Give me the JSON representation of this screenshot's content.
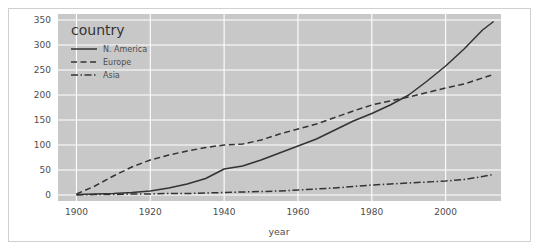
{
  "chart_data": {
    "type": "line",
    "title": "",
    "xlabel": "year",
    "ylabel": "",
    "xlim": [
      1895,
      2015
    ],
    "ylim": [
      -12,
      362
    ],
    "xticks": [
      1900,
      1920,
      1940,
      1960,
      1980,
      2000
    ],
    "yticks": [
      0,
      50,
      100,
      150,
      200,
      250,
      300,
      350
    ],
    "grid": true,
    "legend_title": "country",
    "legend_position": "inside top-left",
    "plot_background": "#c8c8c8",
    "figure_background": "#ffffff",
    "grid_color": "#ffffff",
    "line_color": "#333333",
    "border_color": "#d0d0d0",
    "x": [
      1900,
      1905,
      1910,
      1915,
      1920,
      1925,
      1930,
      1935,
      1940,
      1945,
      1950,
      1955,
      1960,
      1965,
      1970,
      1975,
      1980,
      1985,
      1990,
      1995,
      2000,
      2005,
      2010,
      2013
    ],
    "series": [
      {
        "name": "N. America",
        "style": "solid",
        "values": [
          1,
          2,
          3,
          5,
          8,
          14,
          22,
          33,
          52,
          58,
          70,
          84,
          98,
          112,
          130,
          148,
          163,
          180,
          200,
          228,
          258,
          292,
          330,
          347
        ]
      },
      {
        "name": "Europe",
        "style": "dashed",
        "values": [
          2,
          18,
          38,
          56,
          70,
          80,
          88,
          95,
          100,
          102,
          110,
          122,
          132,
          142,
          155,
          168,
          180,
          188,
          196,
          205,
          214,
          222,
          234,
          241
        ]
      },
      {
        "name": "Asia",
        "style": "dashdot",
        "values": [
          0,
          1,
          1,
          2,
          2,
          3,
          3,
          4,
          5,
          6,
          7,
          8,
          10,
          12,
          14,
          17,
          20,
          22,
          24,
          26,
          28,
          31,
          37,
          41
        ]
      }
    ]
  },
  "axis": {
    "xlabel": "year",
    "xticks": [
      "1900",
      "1920",
      "1940",
      "1960",
      "1980",
      "2000"
    ],
    "yticks": [
      "350",
      "300",
      "250",
      "200",
      "150",
      "100",
      "50",
      "0"
    ]
  },
  "legend": {
    "title": "country",
    "entries": [
      {
        "label": "N. America",
        "style": "solid"
      },
      {
        "label": "Europe",
        "style": "dashed"
      },
      {
        "label": "Asia",
        "style": "dashdot"
      }
    ]
  }
}
